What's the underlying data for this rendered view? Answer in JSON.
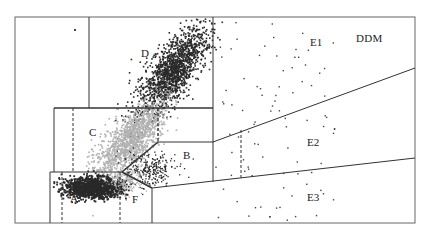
{
  "diagram": {
    "title": "DDM",
    "colors": {
      "background": "#ffffff",
      "border": "#555555",
      "line": "#333333",
      "cluster_dark": "#2a2a2a",
      "cluster_light": "#b0b0b0",
      "scatter": "#444444"
    },
    "regions": [
      {
        "id": "A",
        "label": "A"
      },
      {
        "id": "B",
        "label": "B"
      },
      {
        "id": "C",
        "label": "C"
      },
      {
        "id": "D",
        "label": "D"
      },
      {
        "id": "E1",
        "label": "E1"
      },
      {
        "id": "E2",
        "label": "E2"
      },
      {
        "id": "E3",
        "label": "E3"
      },
      {
        "id": "F",
        "label": "F"
      }
    ]
  }
}
